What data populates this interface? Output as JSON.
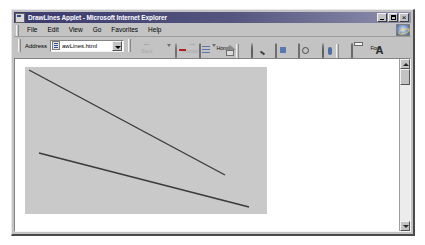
{
  "window": {
    "title": "DrawLines Applet - Microsoft Internet Explorer",
    "title_icon": "page-icon",
    "controls": {
      "minimize": "minimize-button",
      "maximize": "maximize-button",
      "close": "close-button"
    }
  },
  "menu": {
    "items": [
      {
        "label": "File"
      },
      {
        "label": "Edit"
      },
      {
        "label": "View"
      },
      {
        "label": "Go"
      },
      {
        "label": "Favorites"
      },
      {
        "label": "Help"
      }
    ],
    "logo": "ie-logo-icon"
  },
  "address": {
    "label": "Address",
    "value": "awLines.html",
    "placeholder": "awLines.html",
    "favicon": "page-favicon-icon",
    "dropdown": "chevron-down-icon"
  },
  "nav": {
    "back": {
      "label": "Back",
      "glyph": "←",
      "enabled": false
    },
    "forward": {
      "label": "Forward",
      "glyph": "→",
      "enabled": false
    }
  },
  "toolbar": {
    "buttons": [
      {
        "label": "Stop",
        "icon": "stop-icon"
      },
      {
        "label": "Refresh",
        "icon": "refresh-icon"
      },
      {
        "label": "Home",
        "icon": "home-icon"
      },
      {
        "label": "Search",
        "icon": "search-icon"
      },
      {
        "label": "Favorites",
        "icon": "favorites-icon"
      },
      {
        "label": "History",
        "icon": "history-icon"
      },
      {
        "label": "Channels",
        "icon": "channels-icon"
      },
      {
        "label": "Print",
        "icon": "print-icon"
      },
      {
        "label": "Font",
        "icon": "font-icon"
      },
      {
        "label": "",
        "icon": "partial-button-icon"
      }
    ]
  },
  "applet": {
    "name": "DrawLines",
    "background_color": "#c9c9c9",
    "line_color": "#3a3a3a",
    "lines": [
      {
        "name": "line-1",
        "x1": 4,
        "y1": 3,
        "x2": 200,
        "y2": 108
      },
      {
        "name": "line-2",
        "x1": 14,
        "y1": 86,
        "x2": 224,
        "y2": 140
      }
    ]
  },
  "scrollbar": {
    "up": "scroll-up-arrow-icon",
    "down": "scroll-down-arrow-icon",
    "thumb": "scroll-thumb"
  }
}
